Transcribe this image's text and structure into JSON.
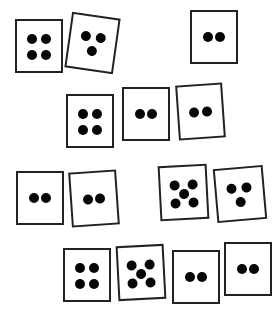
{
  "scene": {
    "description": "Fourteen white dice with black pips scattered on a white background",
    "background": "#ffffff",
    "border_color": "#222222",
    "pip_color": "#050505",
    "total_dice": 14,
    "total_pips": 41
  },
  "dice": [
    {
      "id": 1,
      "value": 4,
      "x": 15,
      "y": 19,
      "w": 48,
      "h": 54,
      "rot": 0
    },
    {
      "id": 2,
      "value": 3,
      "x": 68,
      "y": 15,
      "w": 49,
      "h": 56,
      "rot": 8
    },
    {
      "id": 3,
      "value": 2,
      "x": 190,
      "y": 10,
      "w": 48,
      "h": 54,
      "rot": 0
    },
    {
      "id": 4,
      "value": 4,
      "x": 66,
      "y": 94,
      "w": 48,
      "h": 54,
      "rot": 0
    },
    {
      "id": 5,
      "value": 2,
      "x": 122,
      "y": 87,
      "w": 48,
      "h": 54,
      "rot": 0
    },
    {
      "id": 6,
      "value": 2,
      "x": 177,
      "y": 84,
      "w": 47,
      "h": 55,
      "rot": -4
    },
    {
      "id": 7,
      "value": 2,
      "x": 16,
      "y": 171,
      "w": 48,
      "h": 54,
      "rot": 0
    },
    {
      "id": 8,
      "value": 2,
      "x": 70,
      "y": 171,
      "w": 48,
      "h": 55,
      "rot": -4
    },
    {
      "id": 9,
      "value": 5,
      "x": 159,
      "y": 165,
      "w": 49,
      "h": 55,
      "rot": -3
    },
    {
      "id": 10,
      "value": 3,
      "x": 215,
      "y": 167,
      "w": 50,
      "h": 54,
      "rot": -5
    },
    {
      "id": 11,
      "value": 4,
      "x": 63,
      "y": 248,
      "w": 48,
      "h": 54,
      "rot": 0
    },
    {
      "id": 12,
      "value": 5,
      "x": 117,
      "y": 245,
      "w": 48,
      "h": 55,
      "rot": -3
    },
    {
      "id": 13,
      "value": 2,
      "x": 172,
      "y": 250,
      "w": 48,
      "h": 54,
      "rot": 0
    },
    {
      "id": 14,
      "value": 2,
      "x": 224,
      "y": 242,
      "w": 48,
      "h": 54,
      "rot": 0
    }
  ],
  "pip_layouts": {
    "2": [
      [
        0.36,
        0.5
      ],
      [
        0.64,
        0.5
      ]
    ],
    "3": [
      [
        0.33,
        0.38
      ],
      [
        0.66,
        0.38
      ],
      [
        0.5,
        0.66
      ]
    ],
    "4": [
      [
        0.33,
        0.35
      ],
      [
        0.67,
        0.35
      ],
      [
        0.33,
        0.68
      ],
      [
        0.67,
        0.68
      ]
    ],
    "5": [
      [
        0.3,
        0.35
      ],
      [
        0.7,
        0.35
      ],
      [
        0.5,
        0.52
      ],
      [
        0.3,
        0.7
      ],
      [
        0.7,
        0.7
      ]
    ]
  }
}
